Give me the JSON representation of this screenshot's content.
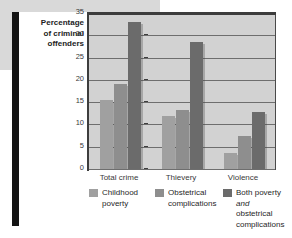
{
  "chart_data": {
    "type": "bar",
    "title": "",
    "xlabel": "",
    "ylabel": "Percentage of criminal offenders",
    "ylim": [
      0,
      35
    ],
    "ytick_values": [
      0,
      5,
      10,
      15,
      20,
      25,
      30,
      35
    ],
    "ytick_labels": [
      "0",
      "5",
      "10",
      "15",
      "20",
      "25",
      "30",
      "35"
    ],
    "categories": [
      "Total crime",
      "Thievery",
      "Violence"
    ],
    "grid": true,
    "legend_position": "bottom",
    "series": [
      {
        "name": "Childhood poverty",
        "color": "#a0a0a0",
        "values": [
          15.5,
          12.0,
          3.5
        ]
      },
      {
        "name": "Obstetrical complications",
        "color": "#8e8e8e",
        "values": [
          19.0,
          13.2,
          7.5
        ]
      },
      {
        "name": "Both poverty and obstetrical complications",
        "color": "#6b6b6b",
        "values": [
          33.0,
          28.5,
          12.8
        ]
      }
    ]
  },
  "axis": {
    "y_title_lines": [
      "Percentage",
      "of criminal",
      "offenders"
    ]
  },
  "legend": {
    "items": [
      {
        "label_line1": "Childhood",
        "label_line2": "poverty",
        "label_line3": "",
        "italic_word": "",
        "color": "#a0a0a0"
      },
      {
        "label_line1": "Obstetrical",
        "label_line2": "complications",
        "label_line3": "",
        "italic_word": "",
        "color": "#8e8e8e"
      },
      {
        "label_line1": "Both poverty",
        "label_line2": "obstetrical",
        "label_line3": "complications",
        "italic_word": "and",
        "color": "#6b6b6b"
      }
    ]
  },
  "colors": {
    "plot_background": "#d2d2d2",
    "grid": "#6e6e6e",
    "frame": "#4a4a4a",
    "page": "#ffffff",
    "left_bar": "#141414",
    "band": "#d9d9d9"
  }
}
